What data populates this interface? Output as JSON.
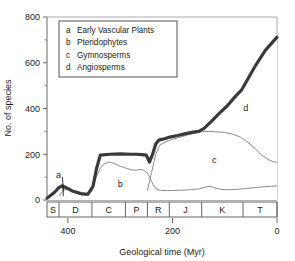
{
  "chart_data": {
    "type": "area",
    "title": "",
    "xlabel": "Geological time (Myr)",
    "ylabel": "No. of species",
    "xlim": [
      440,
      0
    ],
    "ylim": [
      0,
      800
    ],
    "x_reversed": true,
    "grid": false,
    "xticks": [
      400,
      200,
      0
    ],
    "xtick_labels": [
      "400",
      "200",
      "0"
    ],
    "yticks": [
      0,
      200,
      400,
      600,
      800
    ],
    "ytick_labels": [
      "0",
      "200",
      "400",
      "600",
      "800"
    ],
    "yminor_ticks": [
      100,
      300,
      500,
      700
    ],
    "legend_position": "top-left",
    "legend_entries": [
      {
        "key": "a",
        "label": "Early Vascular Plants"
      },
      {
        "key": "b",
        "label": "Pteridophytes"
      },
      {
        "key": "c",
        "label": "Gymnosperms"
      },
      {
        "key": "d",
        "label": "Angiosperms"
      }
    ],
    "plot_annotations": [
      {
        "text": "a",
        "x": 418,
        "y": 95
      },
      {
        "text": "b",
        "x": 300,
        "y": 55
      },
      {
        "text": "c",
        "x": 120,
        "y": 160
      },
      {
        "text": "d",
        "x": 60,
        "y": 390
      }
    ],
    "geological_periods": [
      {
        "symbol": "S",
        "start": 440,
        "end": 417
      },
      {
        "symbol": "D",
        "start": 417,
        "end": 354
      },
      {
        "symbol": "C",
        "start": 354,
        "end": 290
      },
      {
        "symbol": "P",
        "start": 290,
        "end": 248
      },
      {
        "symbol": "R",
        "start": 248,
        "end": 206
      },
      {
        "symbol": "J",
        "start": 206,
        "end": 144
      },
      {
        "symbol": "K",
        "start": 144,
        "end": 65
      },
      {
        "symbol": "T",
        "start": 65,
        "end": 0
      }
    ],
    "series": [
      {
        "name": "Total (upper boundary, thick line)",
        "style": "thick-dark",
        "color": "#3a3a3a",
        "points": [
          [
            440,
            8
          ],
          [
            425,
            35
          ],
          [
            417,
            55
          ],
          [
            410,
            62
          ],
          [
            400,
            50
          ],
          [
            390,
            38
          ],
          [
            375,
            28
          ],
          [
            362,
            25
          ],
          [
            352,
            60
          ],
          [
            345,
            140
          ],
          [
            338,
            196
          ],
          [
            320,
            200
          ],
          [
            300,
            202
          ],
          [
            280,
            200
          ],
          [
            268,
            200
          ],
          [
            258,
            198
          ],
          [
            250,
            196
          ],
          [
            244,
            166
          ],
          [
            238,
            200
          ],
          [
            232,
            245
          ],
          [
            226,
            262
          ],
          [
            215,
            268
          ],
          [
            205,
            275
          ],
          [
            190,
            282
          ],
          [
            175,
            290
          ],
          [
            160,
            297
          ],
          [
            150,
            300
          ],
          [
            140,
            312
          ],
          [
            125,
            345
          ],
          [
            110,
            380
          ],
          [
            95,
            412
          ],
          [
            80,
            452
          ],
          [
            68,
            480
          ],
          [
            55,
            532
          ],
          [
            40,
            592
          ],
          [
            22,
            655
          ],
          [
            0,
            712
          ]
        ]
      },
      {
        "name": "Gymnosperms upper boundary (c)",
        "style": "thin-gray",
        "color": "#808080",
        "points": [
          [
            248,
            40
          ],
          [
            240,
            120
          ],
          [
            232,
            200
          ],
          [
            224,
            240
          ],
          [
            212,
            255
          ],
          [
            200,
            265
          ],
          [
            185,
            275
          ],
          [
            170,
            285
          ],
          [
            155,
            293
          ],
          [
            145,
            298
          ],
          [
            130,
            300
          ],
          [
            115,
            298
          ],
          [
            100,
            295
          ],
          [
            85,
            288
          ],
          [
            70,
            275
          ],
          [
            55,
            252
          ],
          [
            42,
            225
          ],
          [
            30,
            198
          ],
          [
            18,
            178
          ],
          [
            8,
            168
          ],
          [
            0,
            165
          ]
        ]
      },
      {
        "name": "Pteridophytes upper boundary (b)",
        "style": "thin-gray",
        "color": "#808080",
        "points": [
          [
            417,
            18
          ],
          [
            410,
            40
          ],
          [
            402,
            48
          ],
          [
            395,
            42
          ],
          [
            386,
            32
          ],
          [
            375,
            24
          ],
          [
            364,
            20
          ],
          [
            354,
            40
          ],
          [
            346,
            98
          ],
          [
            338,
            140
          ],
          [
            330,
            158
          ],
          [
            322,
            166
          ],
          [
            312,
            160
          ],
          [
            300,
            148
          ],
          [
            288,
            138
          ],
          [
            278,
            132
          ],
          [
            270,
            130
          ],
          [
            262,
            134
          ],
          [
            255,
            130
          ],
          [
            248,
            118
          ],
          [
            242,
            92
          ],
          [
            236,
            62
          ],
          [
            230,
            46
          ],
          [
            222,
            42
          ],
          [
            210,
            41
          ],
          [
            195,
            42
          ],
          [
            180,
            43
          ],
          [
            165,
            45
          ],
          [
            150,
            48
          ],
          [
            138,
            56
          ],
          [
            128,
            60
          ],
          [
            118,
            52
          ],
          [
            105,
            46
          ],
          [
            92,
            45
          ],
          [
            78,
            46
          ],
          [
            60,
            50
          ],
          [
            42,
            54
          ],
          [
            25,
            58
          ],
          [
            10,
            60
          ],
          [
            0,
            62
          ]
        ]
      }
    ]
  }
}
